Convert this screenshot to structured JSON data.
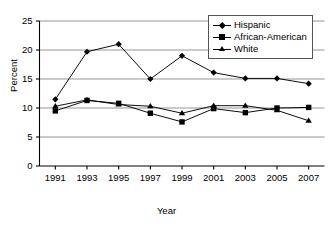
{
  "chart_data": {
    "type": "line",
    "title": "",
    "xlabel": "Year",
    "ylabel": "Percent",
    "categories": [
      "1991",
      "1993",
      "1995",
      "1997",
      "1999",
      "2001",
      "2003",
      "2005",
      "2007"
    ],
    "x": [
      1991,
      1993,
      1995,
      1997,
      1999,
      2001,
      2003,
      2005,
      2007
    ],
    "xlim": [
      1990,
      2008
    ],
    "ylim": [
      0,
      25
    ],
    "yticks": [
      0,
      5,
      10,
      15,
      20,
      25
    ],
    "ytick_labels": [
      "0",
      "5",
      "10",
      "15",
      "20",
      "25"
    ],
    "grid": "horizontal",
    "legend_position": "top-right",
    "series": [
      {
        "name": "Hispanic",
        "marker": "diamond",
        "color": "#000000",
        "values": [
          11.5,
          19.7,
          21.0,
          15.0,
          19.0,
          16.1,
          15.1,
          15.1,
          14.2
        ]
      },
      {
        "name": "African-American",
        "marker": "square",
        "color": "#000000",
        "values": [
          9.5,
          11.3,
          10.8,
          9.1,
          7.6,
          9.9,
          9.2,
          10.0,
          10.1
        ]
      },
      {
        "name": "White",
        "marker": "triangle",
        "color": "#000000",
        "values": [
          10.3,
          11.4,
          10.6,
          10.3,
          9.1,
          10.4,
          10.4,
          9.6,
          7.8
        ]
      }
    ]
  },
  "legend": {
    "items": [
      {
        "label": "Hispanic",
        "marker": "diamond"
      },
      {
        "label": "African-American",
        "marker": "square"
      },
      {
        "label": "White",
        "marker": "triangle"
      }
    ]
  },
  "axes": {
    "y_title": "Percent",
    "x_title": "Year"
  }
}
